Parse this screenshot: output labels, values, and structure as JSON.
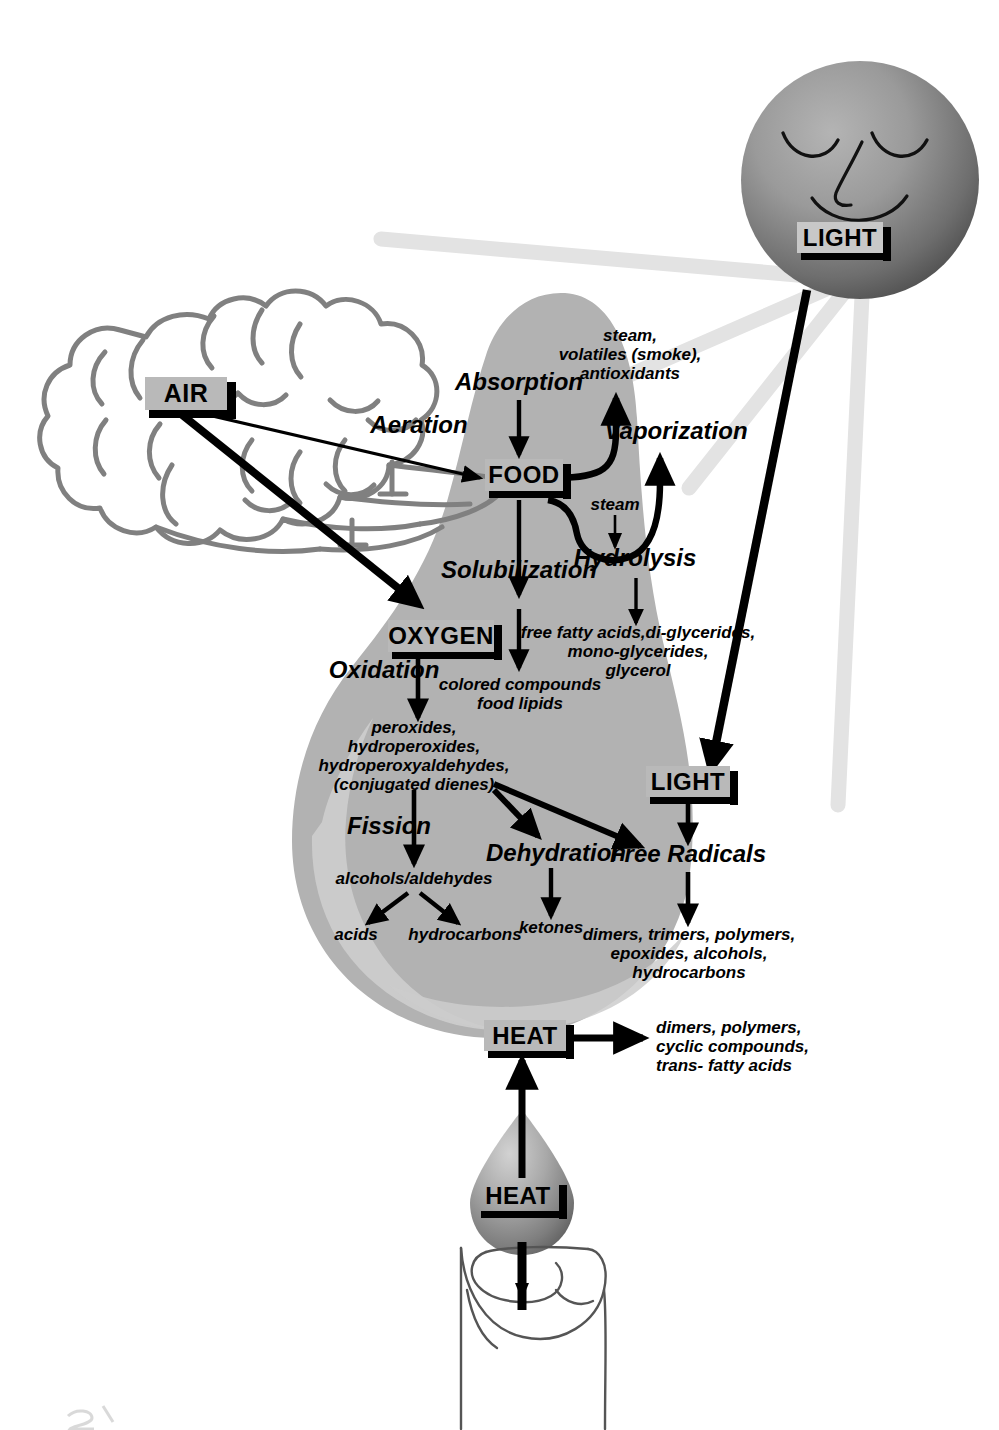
{
  "diagram": {
    "background": "#ffffff",
    "colors": {
      "lipid_mass": "#b2b2b2",
      "lipid_highlight": "#cfcfcf",
      "tag_fill": "#b9b9b9",
      "cloud_stroke": "#808080",
      "light_ray": "#e2e2e2",
      "arrow": "#000000"
    }
  },
  "tags": {
    "air": {
      "label": "AIR"
    },
    "food": {
      "label": "FOOD"
    },
    "oxygen": {
      "label": "OXYGEN"
    },
    "light_sun": {
      "label": "LIGHT"
    },
    "light_lower": {
      "label": "LIGHT"
    },
    "heat_pan": {
      "label": "HEAT"
    },
    "heat_drop": {
      "label": "HEAT"
    }
  },
  "processes": {
    "absorption": "Absorption",
    "aeration": "Aeration",
    "vaporization": "Vaporization",
    "hydrolysis": "Hydrolysis",
    "solubilization": "Solubilization",
    "oxidation": "Oxidation",
    "fission": "Fission",
    "dehydration": "Dehydration",
    "free_radicals": "Free Radicals"
  },
  "products": {
    "vaporization_products": "steam,\nvolatiles (smoke),\nantioxidants",
    "steam": "steam",
    "hydrolysis_products": "free fatty acids,di-glycerides,\nmono-glycerides,\nglycerol",
    "solubilization_products": "colored compounds\nfood lipids",
    "oxidation_products": "peroxides,\nhydroperoxides,\nhydroperoxyaldehydes,\n(conjugated dienes)",
    "fission_products": "alcohols/aldehydes",
    "acids": "acids",
    "hydrocarbons": "hydrocarbons",
    "ketones": "ketones",
    "free_radical_products": "dimers, trimers, polymers,\nepoxides, alcohols,\nhydrocarbons",
    "heat_products": "dimers, polymers,\ncyclic compounds,\ntrans- fatty acids"
  },
  "objects": {
    "sun": {
      "name": "sun-face",
      "expression": "closed-eyes-smiling"
    },
    "cloud": {
      "name": "air-cloud"
    },
    "lipid_mass": {
      "name": "frying-lipid-mass"
    },
    "oil_droplet": {
      "name": "oil-droplet"
    },
    "burner": {
      "name": "stove-burner"
    }
  }
}
